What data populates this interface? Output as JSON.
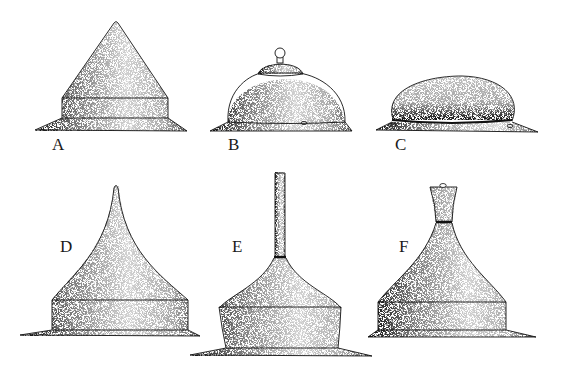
{
  "figure": {
    "ink_color": "#111111",
    "paper_color": "#ffffff",
    "panels": [
      {
        "id": "A",
        "label": "A",
        "shape": "conical helmet with band and flat brim"
      },
      {
        "id": "B",
        "label": "B",
        "shape": "domed helmet with small cap and knob finial"
      },
      {
        "id": "C",
        "label": "C",
        "shape": "low oval cap on flat brim"
      },
      {
        "id": "D",
        "label": "D",
        "shape": "concave-sided pointed helmet with band and brim"
      },
      {
        "id": "E",
        "label": "E",
        "shape": "spiked helmet with tall rod finial, band and brim"
      },
      {
        "id": "F",
        "label": "F",
        "shape": "bottle-neck finial helmet with band and brim"
      }
    ]
  }
}
